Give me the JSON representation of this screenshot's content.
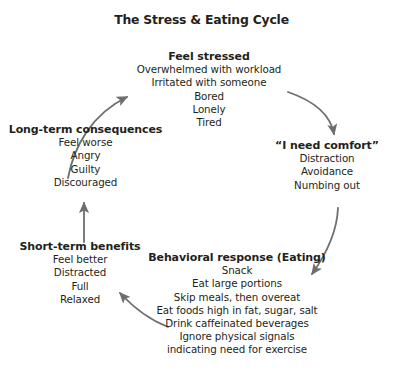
{
  "title": "The Stress & Eating Cycle",
  "colors": {
    "text": "#231f20",
    "arrow": "#6e6e6e",
    "background": "#ffffff"
  },
  "diagram": {
    "type": "cycle-flowchart",
    "node_order": [
      "feel-stressed",
      "i-need-comfort",
      "behavioral-response",
      "short-term-benefits",
      "long-term-consequences"
    ],
    "nodes": [
      {
        "id": "feel-stressed",
        "title": "Feel stressed",
        "items": [
          "Overwhelmed with workload",
          "Irritated with someone",
          "Bored",
          "Lonely",
          "Tired"
        ]
      },
      {
        "id": "i-need-comfort",
        "title": "“I need comfort”",
        "items": [
          "Distraction",
          "Avoidance",
          "Numbing out"
        ]
      },
      {
        "id": "behavioral-response",
        "title": "Behavioral response (Eating)",
        "items": [
          "Snack",
          "Eat large portions",
          "Skip meals, then overeat",
          "Eat foods high in fat, sugar, salt",
          "Drink caffeinated beverages",
          "Ignore physical signals",
          "indicating need for exercise"
        ]
      },
      {
        "id": "short-term-benefits",
        "title": "Short-term benefits",
        "items": [
          "Feel better",
          "Distracted",
          "Full",
          "Relaxed"
        ]
      },
      {
        "id": "long-term-consequences",
        "title": "Long-term consequences",
        "items": [
          "Feel worse",
          "Angry",
          "Guilty",
          "Discouraged"
        ]
      }
    ],
    "arrows": [
      {
        "id": "stressed-to-comfort",
        "from": "feel-stressed",
        "to": "i-need-comfort",
        "style": "curved"
      },
      {
        "id": "comfort-to-behavior",
        "from": "i-need-comfort",
        "to": "behavioral-response",
        "style": "curved"
      },
      {
        "id": "behavior-to-shortterm",
        "from": "behavioral-response",
        "to": "short-term-benefits",
        "style": "curved"
      },
      {
        "id": "shortterm-to-longterm",
        "from": "short-term-benefits",
        "to": "long-term-consequences",
        "style": "straight"
      },
      {
        "id": "longterm-to-stressed",
        "from": "long-term-consequences",
        "to": "feel-stressed",
        "style": "curved"
      }
    ]
  }
}
